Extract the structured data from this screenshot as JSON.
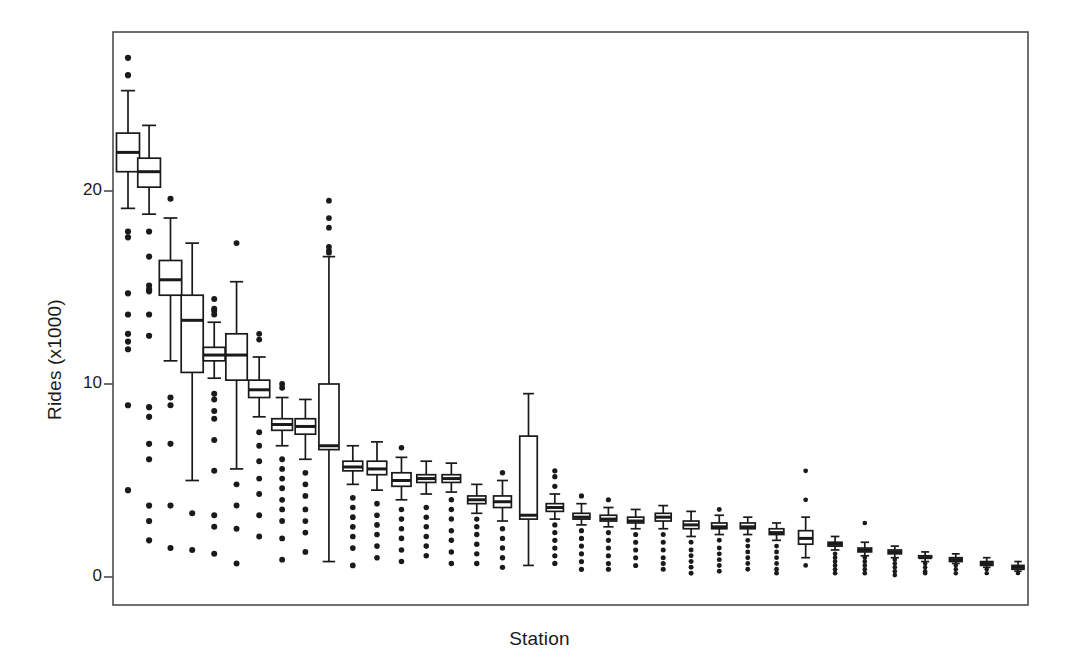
{
  "chart_data": {
    "type": "boxplot",
    "title": "",
    "xlabel": "Station",
    "ylabel": "Rides (x1000)",
    "xlim": [
      0,
      36
    ],
    "ylim": [
      -1.5,
      28.2
    ],
    "grid": false,
    "legend": null,
    "yticks": [
      0,
      10,
      20
    ],
    "ytick_labels": [
      "0",
      "10",
      "20"
    ],
    "xticks": [],
    "xtick_labels": [],
    "box_fill": "#ffffff",
    "line_color": "#1a1a1a",
    "outlier_marker": "filled-circle",
    "n_boxes": 35,
    "categories": [
      "S1",
      "S2",
      "S3",
      "S4",
      "S5",
      "S6",
      "S7",
      "S8",
      "S9",
      "S10",
      "S11",
      "S12",
      "S13",
      "S14",
      "S15",
      "S16",
      "S17",
      "S18",
      "S19",
      "S20",
      "S21",
      "S22",
      "S23",
      "S24",
      "S25",
      "S26",
      "S27",
      "S28",
      "S29",
      "S30",
      "S31",
      "S32",
      "S33",
      "S34",
      "S35"
    ],
    "boxes": [
      {
        "station": "S1",
        "whisker_low": 19.1,
        "q1": 21.0,
        "median": 22.0,
        "q3": 23.0,
        "whisker_high": 25.2,
        "outliers": [
          26.9,
          26.0,
          17.9,
          17.6,
          14.7,
          13.6,
          12.6,
          12.2,
          11.8,
          8.9,
          4.5
        ]
      },
      {
        "station": "S2",
        "whisker_low": 18.8,
        "q1": 20.2,
        "median": 21.0,
        "q3": 21.7,
        "whisker_high": 23.4,
        "outliers": [
          17.9,
          16.6,
          15.1,
          14.9,
          14.8,
          13.6,
          12.5,
          8.8,
          8.3,
          6.9,
          6.1,
          3.7,
          2.9,
          1.9
        ]
      },
      {
        "station": "S3",
        "whisker_low": 11.2,
        "q1": 14.6,
        "median": 15.4,
        "q3": 16.4,
        "whisker_high": 18.6,
        "outliers": [
          19.6,
          9.3,
          8.9,
          6.9,
          3.7,
          1.5
        ]
      },
      {
        "station": "S4",
        "whisker_low": 5.0,
        "q1": 10.6,
        "median": 13.3,
        "q3": 14.6,
        "whisker_high": 17.3,
        "outliers": [
          3.3,
          1.4
        ]
      },
      {
        "station": "S5",
        "whisker_low": 10.3,
        "q1": 11.2,
        "median": 11.5,
        "q3": 11.9,
        "whisker_high": 13.2,
        "outliers": [
          14.4,
          13.9,
          13.8,
          13.6,
          9.5,
          9.2,
          8.6,
          8.2,
          7.1,
          5.5,
          3.2,
          2.6,
          1.2
        ]
      },
      {
        "station": "S6",
        "whisker_low": 5.6,
        "q1": 10.2,
        "median": 11.5,
        "q3": 12.6,
        "whisker_high": 15.3,
        "outliers": [
          17.3,
          4.8,
          3.7,
          2.5,
          0.7
        ]
      },
      {
        "station": "S7",
        "whisker_low": 8.3,
        "q1": 9.3,
        "median": 9.7,
        "q3": 10.2,
        "whisker_high": 11.4,
        "outliers": [
          12.6,
          12.3,
          7.5,
          6.8,
          6.0,
          5.1,
          4.3,
          3.2,
          2.1
        ]
      },
      {
        "station": "S8",
        "whisker_low": 6.8,
        "q1": 7.6,
        "median": 7.9,
        "q3": 8.2,
        "whisker_high": 9.3,
        "outliers": [
          10.0,
          9.8,
          6.1,
          5.6,
          5.1,
          4.6,
          4.0,
          3.5,
          2.9,
          2.0,
          0.9
        ]
      },
      {
        "station": "S9",
        "whisker_low": 6.1,
        "q1": 7.4,
        "median": 7.8,
        "q3": 8.2,
        "whisker_high": 9.2,
        "outliers": [
          5.4,
          4.8,
          4.2,
          3.5,
          2.9,
          2.3,
          1.3
        ]
      },
      {
        "station": "S10",
        "whisker_low": 0.8,
        "q1": 6.6,
        "median": 6.8,
        "q3": 10.0,
        "whisker_high": 16.6,
        "outliers": [
          19.5,
          18.6,
          18.1,
          17.1,
          16.9,
          16.8
        ]
      },
      {
        "station": "S11",
        "whisker_low": 4.8,
        "q1": 5.5,
        "median": 5.7,
        "q3": 6.0,
        "whisker_high": 6.8,
        "outliers": [
          4.1,
          3.6,
          3.1,
          2.6,
          2.1,
          1.5,
          0.6
        ]
      },
      {
        "station": "S12",
        "whisker_low": 4.5,
        "q1": 5.3,
        "median": 5.6,
        "q3": 6.0,
        "whisker_high": 7.0,
        "outliers": [
          3.8,
          3.2,
          2.7,
          2.2,
          1.6,
          1.0
        ]
      },
      {
        "station": "S13",
        "whisker_low": 4.0,
        "q1": 4.7,
        "median": 5.0,
        "q3": 5.4,
        "whisker_high": 6.2,
        "outliers": [
          6.7,
          3.5,
          3.0,
          2.5,
          2.0,
          1.4,
          0.8
        ]
      },
      {
        "station": "S14",
        "whisker_low": 4.3,
        "q1": 4.9,
        "median": 5.1,
        "q3": 5.3,
        "whisker_high": 6.0,
        "outliers": [
          3.6,
          3.1,
          2.6,
          2.1,
          1.6,
          1.1
        ]
      },
      {
        "station": "S15",
        "whisker_low": 4.4,
        "q1": 4.9,
        "median": 5.1,
        "q3": 5.3,
        "whisker_high": 5.9,
        "outliers": [
          4.0,
          3.5,
          3.0,
          2.4,
          1.9,
          1.3,
          0.7
        ]
      },
      {
        "station": "S16",
        "whisker_low": 3.3,
        "q1": 3.8,
        "median": 4.0,
        "q3": 4.2,
        "whisker_high": 4.8,
        "outliers": [
          3.0,
          2.6,
          2.2,
          1.7,
          1.2,
          0.7
        ]
      },
      {
        "station": "S17",
        "whisker_low": 2.9,
        "q1": 3.6,
        "median": 3.9,
        "q3": 4.2,
        "whisker_high": 5.0,
        "outliers": [
          5.4,
          2.5,
          2.0,
          1.5,
          1.0,
          0.5
        ]
      },
      {
        "station": "S18",
        "whisker_low": 0.6,
        "q1": 3.0,
        "median": 3.2,
        "q3": 7.3,
        "whisker_high": 9.5,
        "outliers": []
      },
      {
        "station": "S19",
        "whisker_low": 3.0,
        "q1": 3.4,
        "median": 3.6,
        "q3": 3.8,
        "whisker_high": 4.3,
        "outliers": [
          5.5,
          5.2,
          4.7,
          2.7,
          2.3,
          1.9,
          1.5,
          1.1,
          0.7
        ]
      },
      {
        "station": "S20",
        "whisker_low": 2.7,
        "q1": 3.0,
        "median": 3.1,
        "q3": 3.3,
        "whisker_high": 3.8,
        "outliers": [
          4.2,
          2.4,
          2.0,
          1.6,
          1.2,
          0.8,
          0.4
        ]
      },
      {
        "station": "S21",
        "whisker_low": 2.6,
        "q1": 2.9,
        "median": 3.0,
        "q3": 3.2,
        "whisker_high": 3.6,
        "outliers": [
          4.0,
          2.3,
          1.9,
          1.5,
          1.1,
          0.7,
          0.4
        ]
      },
      {
        "station": "S22",
        "whisker_low": 2.5,
        "q1": 2.8,
        "median": 2.9,
        "q3": 3.1,
        "whisker_high": 3.5,
        "outliers": [
          2.2,
          1.8,
          1.4,
          1.0,
          0.6
        ]
      },
      {
        "station": "S23",
        "whisker_low": 2.5,
        "q1": 2.9,
        "median": 3.1,
        "q3": 3.3,
        "whisker_high": 3.7,
        "outliers": [
          2.2,
          1.8,
          1.4,
          1.0,
          0.7,
          0.4
        ]
      },
      {
        "station": "S24",
        "whisker_low": 2.1,
        "q1": 2.5,
        "median": 2.7,
        "q3": 2.9,
        "whisker_high": 3.4,
        "outliers": [
          1.8,
          1.4,
          1.1,
          0.8,
          0.5,
          0.2
        ]
      },
      {
        "station": "S25",
        "whisker_low": 2.2,
        "q1": 2.5,
        "median": 2.6,
        "q3": 2.8,
        "whisker_high": 3.2,
        "outliers": [
          3.5,
          1.9,
          1.5,
          1.2,
          0.9,
          0.6,
          0.3
        ]
      },
      {
        "station": "S26",
        "whisker_low": 2.2,
        "q1": 2.5,
        "median": 2.6,
        "q3": 2.8,
        "whisker_high": 3.1,
        "outliers": [
          1.9,
          1.6,
          1.3,
          1.0,
          0.7,
          0.4
        ]
      },
      {
        "station": "S27",
        "whisker_low": 1.9,
        "q1": 2.2,
        "median": 2.3,
        "q3": 2.5,
        "whisker_high": 2.8,
        "outliers": [
          1.6,
          1.3,
          1.0,
          0.7,
          0.4,
          0.2
        ]
      },
      {
        "station": "S28",
        "whisker_low": 1.0,
        "q1": 1.7,
        "median": 2.0,
        "q3": 2.4,
        "whisker_high": 3.1,
        "outliers": [
          5.5,
          4.0,
          0.6
        ]
      },
      {
        "station": "S29",
        "whisker_low": 1.4,
        "q1": 1.6,
        "median": 1.7,
        "q3": 1.8,
        "whisker_high": 2.1,
        "outliers": [
          1.2,
          1.0,
          0.8,
          0.6,
          0.4,
          0.2
        ]
      },
      {
        "station": "S30",
        "whisker_low": 1.1,
        "q1": 1.3,
        "median": 1.4,
        "q3": 1.5,
        "whisker_high": 1.8,
        "outliers": [
          2.8,
          1.0,
          0.8,
          0.6,
          0.4,
          0.2
        ]
      },
      {
        "station": "S31",
        "whisker_low": 1.0,
        "q1": 1.2,
        "median": 1.3,
        "q3": 1.4,
        "whisker_high": 1.6,
        "outliers": [
          0.9,
          0.7,
          0.5,
          0.3,
          0.1
        ]
      },
      {
        "station": "S32",
        "whisker_low": 0.8,
        "q1": 1.0,
        "median": 1.0,
        "q3": 1.1,
        "whisker_high": 1.3,
        "outliers": [
          0.7,
          0.5,
          0.3,
          0.2
        ]
      },
      {
        "station": "S33",
        "whisker_low": 0.7,
        "q1": 0.8,
        "median": 0.9,
        "q3": 1.0,
        "whisker_high": 1.2,
        "outliers": [
          0.6,
          0.4,
          0.2
        ]
      },
      {
        "station": "S34",
        "whisker_low": 0.5,
        "q1": 0.6,
        "median": 0.7,
        "q3": 0.8,
        "whisker_high": 1.0,
        "outliers": [
          0.4,
          0.2
        ]
      },
      {
        "station": "S35",
        "whisker_low": 0.3,
        "q1": 0.4,
        "median": 0.5,
        "q3": 0.6,
        "whisker_high": 0.8,
        "outliers": [
          0.2
        ]
      }
    ]
  },
  "figure": {
    "background": "#ffffff",
    "frame_color": "#4d4d4d",
    "plot_area": {
      "left": 113,
      "top": 32,
      "right": 1028,
      "bottom": 605
    }
  },
  "labels": {
    "x_axis_title": "Station",
    "y_axis_title": "Rides (x1000)",
    "tick_0": "0",
    "tick_10": "10",
    "tick_20": "20"
  }
}
